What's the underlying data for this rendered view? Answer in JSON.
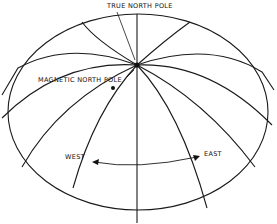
{
  "diagram": {
    "labels": {
      "true_north": "TRUE NORTH POLE",
      "magnetic_north": "MAGNETIC NORTH POLE",
      "west": "WEST",
      "east": "EAST"
    },
    "colors": {
      "line": "#1a1a1a",
      "background": "#ffffff"
    }
  }
}
